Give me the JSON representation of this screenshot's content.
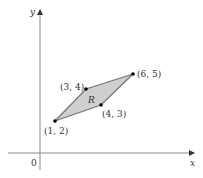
{
  "diagram": {
    "axes": {
      "x_label": "x",
      "y_label": "y",
      "origin_label": "0",
      "axis_color": "#8a8a8a"
    },
    "region": {
      "label": "R",
      "fill": "#cfcfcf",
      "stroke": "#777777",
      "vertices": [
        {
          "label": "(1, 2)",
          "x": 1,
          "y": 2
        },
        {
          "label": "(4, 3)",
          "x": 4,
          "y": 3
        },
        {
          "label": "(6, 5)",
          "x": 6,
          "y": 5
        },
        {
          "label": "(3, 4)",
          "x": 3,
          "y": 4
        }
      ]
    }
  }
}
